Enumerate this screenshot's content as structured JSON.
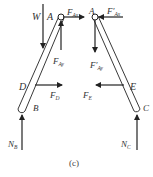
{
  "figure": {
    "caption": "(c)",
    "colors": {
      "line": "#222222",
      "text": "#333333",
      "background": "#ffffff"
    },
    "labels": {
      "W": "W",
      "A_left": "A",
      "A_right": "A",
      "D": "D",
      "B": "B",
      "E": "E",
      "C": "C",
      "F_Ax": {
        "main": "F",
        "sub": "Ax"
      },
      "F_Ay": {
        "main": "F",
        "sub": "Ay"
      },
      "F_Ax_prime": {
        "main": "F′",
        "sub": "Ax"
      },
      "F_Ay_prime": {
        "main": "F′",
        "sub": "Ay"
      },
      "F_D": {
        "main": "F",
        "sub": "D"
      },
      "F_E": {
        "main": "F",
        "sub": "E"
      },
      "N_B": {
        "main": "N",
        "sub": "B"
      },
      "N_C": {
        "main": "N",
        "sub": "C"
      }
    }
  }
}
